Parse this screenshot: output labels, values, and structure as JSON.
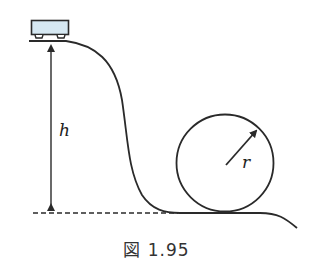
{
  "figure": {
    "caption": "図 1.95",
    "labels": {
      "height": "h",
      "radius": "r"
    },
    "colors": {
      "stroke": "#2a2a2a",
      "cart_fill": "#d6e8f2",
      "background": "#ffffff"
    },
    "elements": [
      "cart",
      "track",
      "height-arrow",
      "ground-dashed-line",
      "loop-circle",
      "radius-arrow"
    ]
  }
}
